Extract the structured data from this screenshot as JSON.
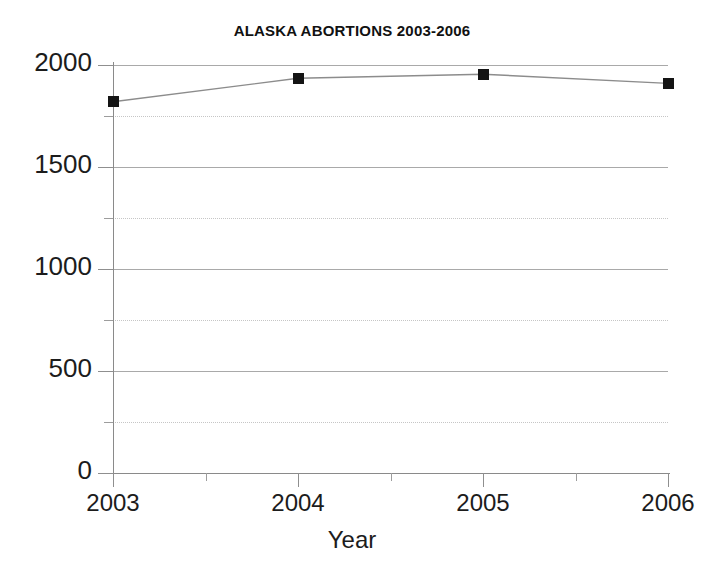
{
  "chart_data": {
    "type": "line",
    "title": "ALASKA ABORTIONS 2003-2006",
    "xlabel": "Year",
    "ylabel": "",
    "categories": [
      "2003",
      "2004",
      "2005",
      "2006"
    ],
    "x": [
      2003,
      2004,
      2005,
      2006
    ],
    "values": [
      1820,
      1935,
      1955,
      1910
    ],
    "series": [
      {
        "name": "Alaska abortions",
        "values": [
          1820,
          1935,
          1955,
          1910
        ],
        "marker": "square",
        "marker_color": "#141414",
        "line_color": "#8c8c8c"
      }
    ],
    "ylim": [
      0,
      2000
    ],
    "xlim": [
      2003,
      2006
    ],
    "y_major_ticks": [
      0,
      500,
      1000,
      1500,
      2000
    ],
    "y_minor_ticks": [
      250,
      750,
      1250,
      1750
    ],
    "y_tick_labels": [
      "0",
      "500",
      "1000",
      "1500",
      "2000"
    ],
    "x_tick_labels": [
      "2003",
      "2004",
      "2005",
      "2006"
    ],
    "x_minor_ticks": [
      2003.5,
      2004.5,
      2005.5
    ],
    "grid": {
      "major_horizontal": true,
      "minor_horizontal": true,
      "vertical": false,
      "major_style": "solid",
      "minor_style": "dotted",
      "major_color": "#a9a9a9",
      "minor_color": "#c6c6c6"
    },
    "legend": null,
    "legend_position": "none",
    "annotations": []
  },
  "colors": {
    "background": "#ffffff",
    "axis": "#8a8a8a",
    "text": "#1c1c1c",
    "marker": "#141414",
    "line": "#8c8c8c"
  }
}
